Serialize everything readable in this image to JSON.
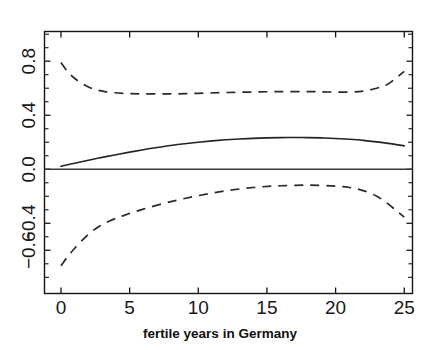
{
  "chart_data": {
    "type": "line",
    "title": "",
    "subtitle": "",
    "xlabel": "fertile years in Germany",
    "ylabel": "",
    "xlim": [
      -1.2,
      25.6
    ],
    "ylim": [
      -0.92,
      1.02
    ],
    "grid": false,
    "legend": null,
    "xticks": [
      0,
      5,
      10,
      15,
      20,
      25
    ],
    "xtick_labels": [
      "0",
      "5",
      "10",
      "15",
      "20",
      "25"
    ],
    "yticks": [
      0.8,
      0.4,
      0.0,
      -0.4,
      -0.6
    ],
    "ytick_labels": [
      "0.8",
      "0.4",
      "0.0",
      "-0.4",
      "-0.6"
    ],
    "ytick_labels_visible": [
      "0.8",
      "0.4",
      "0.0",
      "−0.4",
      "−0.6"
    ],
    "yminor_ticks": [
      1.0,
      0.6,
      0.2,
      -0.2,
      -0.8
    ],
    "annotations": [],
    "series": [
      {
        "name": "upper confidence band",
        "style": "dashed",
        "color": "#2a2a2a",
        "x": [
          0,
          0.6,
          1.3,
          2.2,
          3.2,
          4.5,
          6,
          8,
          10,
          12,
          14,
          16,
          18,
          19.5,
          21,
          22,
          23,
          23.8,
          24.4,
          25
        ],
        "y": [
          0.79,
          0.71,
          0.65,
          0.6,
          0.575,
          0.562,
          0.558,
          0.558,
          0.562,
          0.568,
          0.572,
          0.575,
          0.575,
          0.572,
          0.572,
          0.578,
          0.6,
          0.63,
          0.675,
          0.725
        ]
      },
      {
        "name": "fitted effect",
        "style": "solid",
        "color": "#232323",
        "x": [
          0,
          1,
          2,
          3,
          4,
          5,
          6,
          7,
          8,
          9,
          10,
          11,
          12,
          13,
          14,
          15,
          16,
          17,
          18,
          19,
          20,
          21,
          22,
          23,
          24,
          25
        ],
        "y": [
          0.022,
          0.045,
          0.067,
          0.088,
          0.108,
          0.127,
          0.145,
          0.161,
          0.176,
          0.189,
          0.2,
          0.21,
          0.218,
          0.224,
          0.229,
          0.232,
          0.234,
          0.235,
          0.234,
          0.232,
          0.228,
          0.222,
          0.214,
          0.203,
          0.19,
          0.173
        ]
      },
      {
        "name": "lower confidence band",
        "style": "dashed",
        "color": "#2a2a2a",
        "x": [
          0,
          0.5,
          1,
          1.8,
          2.6,
          3.5,
          4.5,
          6,
          8,
          10,
          12,
          14,
          16,
          18,
          20,
          21,
          22,
          23,
          23.8,
          24.4,
          25
        ],
        "y": [
          -0.715,
          -0.645,
          -0.585,
          -0.5,
          -0.435,
          -0.385,
          -0.345,
          -0.295,
          -0.24,
          -0.195,
          -0.16,
          -0.135,
          -0.122,
          -0.118,
          -0.125,
          -0.135,
          -0.158,
          -0.2,
          -0.255,
          -0.305,
          -0.355
        ]
      },
      {
        "name": "zero reference line",
        "style": "solid",
        "color": "#3a3a3a",
        "x": [
          -1.2,
          25.6
        ],
        "y": [
          0.0,
          0.0
        ]
      }
    ]
  },
  "axis": {
    "x_title": "fertile years in Germany",
    "x_tick_0": "0",
    "x_tick_1": "5",
    "x_tick_2": "10",
    "x_tick_3": "15",
    "x_tick_4": "20",
    "x_tick_5": "25",
    "y_tick_0": "0.8",
    "y_tick_1": "0.4",
    "y_tick_2": "0.0",
    "y_tick_3": "−0.4",
    "y_tick_4": "−0.6"
  },
  "colors": {
    "background": "#ffffff",
    "axis": "#141414",
    "solid_curve": "#232323",
    "dashed_curve": "#2a2a2a",
    "zero_line": "#3a3a3a"
  }
}
